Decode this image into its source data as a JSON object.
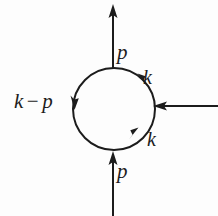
{
  "figure": {
    "type": "feynman-diagram",
    "background_color": "#fdfdfd",
    "ink_color": "#1c1c1c",
    "labels": {
      "momentum_p_top": "p",
      "momentum_p_bottom": "p",
      "loop_k_upper": "k",
      "loop_k_lower": "k",
      "loop_k_minus_p": "k",
      "loop_minus_operator": "−",
      "loop_p": "p"
    },
    "geometry": {
      "loop_center_x": 114,
      "loop_center_y": 109,
      "loop_radius": 41,
      "external_top_x": 113,
      "external_top_tip_y": 6,
      "external_bottom_x": 113,
      "external_bottom_end_y": 216,
      "external_right_y": 106,
      "external_right_end_x": 218,
      "stroke_width": 2
    }
  }
}
